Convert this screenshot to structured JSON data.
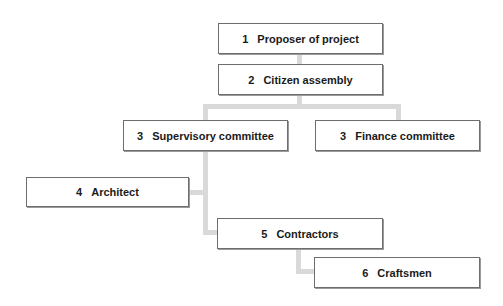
{
  "diagram": {
    "type": "organizational-hierarchy",
    "nodes": [
      {
        "id": "n1",
        "number": "1",
        "label": "Proposer of project"
      },
      {
        "id": "n2",
        "number": "2",
        "label": "Citizen assembly"
      },
      {
        "id": "n3a",
        "number": "3",
        "label": "Supervisory committee"
      },
      {
        "id": "n3b",
        "number": "3",
        "label": "Finance committee"
      },
      {
        "id": "n4",
        "number": "4",
        "label": "Architect"
      },
      {
        "id": "n5",
        "number": "5",
        "label": "Contractors"
      },
      {
        "id": "n6",
        "number": "6",
        "label": "Craftsmen"
      }
    ],
    "edges": [
      [
        "n1",
        "n2"
      ],
      [
        "n2",
        "n3a"
      ],
      [
        "n2",
        "n3b"
      ],
      [
        "n3a",
        "n4"
      ],
      [
        "n3a",
        "n5"
      ],
      [
        "n5",
        "n6"
      ]
    ],
    "colors": {
      "connector": "#d9d9d9",
      "box_border": "#6e6e6e",
      "text": "#1a1a1a"
    }
  }
}
